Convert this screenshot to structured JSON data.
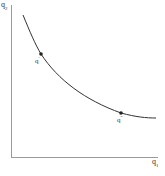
{
  "diagram": {
    "type": "indifference-curve",
    "axes": {
      "y_label": "q",
      "y_sub": "2",
      "x_label": "q",
      "x_sub": "1"
    },
    "points": [
      {
        "label": "q",
        "prime": "′",
        "x": 41,
        "y": 54
      },
      {
        "label": "q",
        "prime": "″",
        "x": 121,
        "y": 113
      }
    ],
    "curve_color": "#333333",
    "axis_color": "#999999"
  }
}
